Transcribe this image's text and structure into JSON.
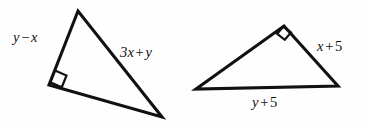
{
  "figure": {
    "name": "two-right-triangles",
    "background_color": "#fefefe",
    "stroke_color": "#111111",
    "width": 365,
    "height": 130
  },
  "triangle_left": {
    "name": "left-right-triangle",
    "vertices": {
      "apex": [
        78,
        11
      ],
      "right_angle": [
        49,
        85
      ],
      "bottom_right": [
        162,
        117
      ]
    },
    "path": "M 78 11 L 49 85 L 162 117 Z",
    "right_angle_marker": {
      "present": true,
      "path": "M 55.0 70.5 L 66.5 75.5 L 61.8 87.2 L 50.2 82.3 Z"
    },
    "labels": {
      "left_leg": {
        "text": "y − x",
        "var1": "y",
        "operator": "−",
        "var2": "x"
      },
      "hypotenuse": {
        "text": "3x + y",
        "term1": "3x",
        "operator": "+",
        "term2": "y"
      }
    }
  },
  "triangle_right": {
    "name": "right-right-triangle",
    "vertices": {
      "left": [
        196,
        89
      ],
      "apex_right_angle": [
        284,
        26
      ],
      "right": [
        338,
        86
      ]
    },
    "path": "M 196 89 L 284 26 L 338 86 Z",
    "right_angle_marker": {
      "present": true,
      "path": "M 277.2 33.8 L 284.8 39.8 L 291.0 32.4 L 283.4 26.6 Z"
    },
    "labels": {
      "right_leg": {
        "text": "x + 5",
        "var1": "x",
        "operator": "+",
        "num": "5"
      },
      "base": {
        "text": "y + 5",
        "var1": "y",
        "operator": "+",
        "num": "5"
      }
    }
  },
  "labels": {
    "y_minus_x": {
      "var1": "y",
      "op": "−",
      "var2": "x"
    },
    "three_x_plus_y": {
      "term1": "3x",
      "op": "+",
      "term2": "y"
    },
    "x_plus_5": {
      "var1": "x",
      "op": "+",
      "num": "5"
    },
    "y_plus_5": {
      "var1": "y",
      "op": "+",
      "num": "5"
    }
  }
}
